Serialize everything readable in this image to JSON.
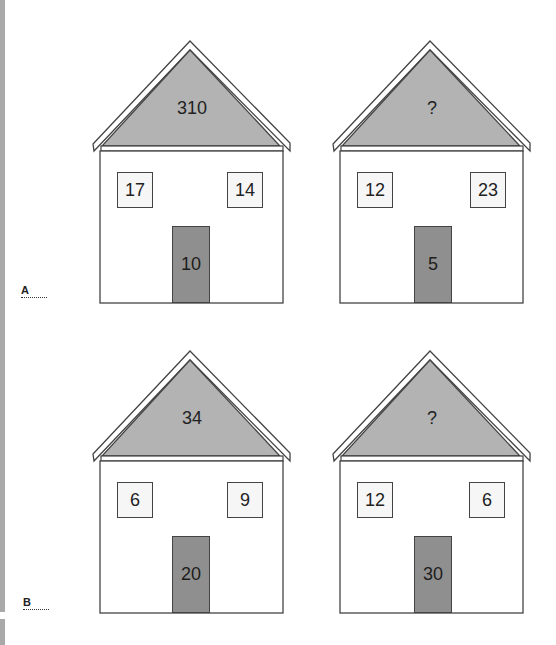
{
  "puzzle": {
    "rows": [
      {
        "label": "A",
        "houses": [
          {
            "roof": "310",
            "window_left": "17",
            "window_right": "14",
            "door": "10"
          },
          {
            "roof": "?",
            "window_left": "12",
            "window_right": "23",
            "door": "5"
          }
        ]
      },
      {
        "label": "B",
        "houses": [
          {
            "roof": "34",
            "window_left": "6",
            "window_right": "9",
            "door": "20"
          },
          {
            "roof": "?",
            "window_left": "12",
            "window_right": "6",
            "door": "30"
          }
        ]
      }
    ]
  },
  "colors": {
    "roof_fill": "#b3b3b3",
    "door_fill": "#8f8f8f",
    "outline": "#444444",
    "window_fill": "#f6f6f6"
  }
}
